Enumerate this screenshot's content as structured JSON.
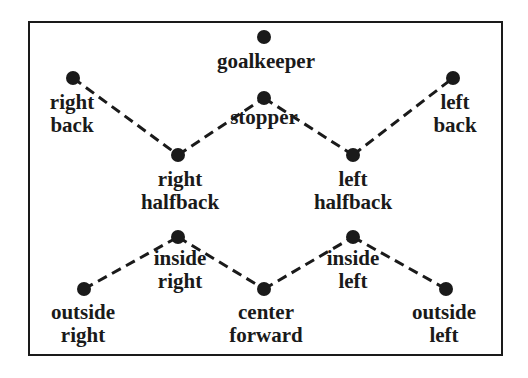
{
  "diagram": {
    "type": "soccer-formation",
    "colors": {
      "ink": "#1a1a1a",
      "background": "#ffffff"
    },
    "positions": [
      {
        "id": "goalkeeper",
        "lines": [
          "goalkeeper"
        ],
        "x": 264,
        "y": 37
      },
      {
        "id": "stopper",
        "lines": [
          "stopper"
        ],
        "x": 264,
        "y": 98
      },
      {
        "id": "right-back",
        "lines": [
          "right",
          "back"
        ],
        "x": 73,
        "y": 78
      },
      {
        "id": "left-back",
        "lines": [
          "left",
          "back"
        ],
        "x": 453,
        "y": 78
      },
      {
        "id": "right-halfback",
        "lines": [
          "right",
          "halfback"
        ],
        "x": 178,
        "y": 155
      },
      {
        "id": "left-halfback",
        "lines": [
          "left",
          "halfback"
        ],
        "x": 353,
        "y": 155
      },
      {
        "id": "inside-right",
        "lines": [
          "inside",
          "right"
        ],
        "x": 178,
        "y": 237
      },
      {
        "id": "inside-left",
        "lines": [
          "inside",
          "left"
        ],
        "x": 353,
        "y": 237
      },
      {
        "id": "outside-right",
        "lines": [
          "outside",
          "right"
        ],
        "x": 84,
        "y": 289
      },
      {
        "id": "center-forward",
        "lines": [
          "center",
          "forward"
        ],
        "x": 264,
        "y": 289
      },
      {
        "id": "outside-left",
        "lines": [
          "outside",
          "left"
        ],
        "x": 446,
        "y": 289
      }
    ],
    "connections": [
      [
        "right-back",
        "right-halfback"
      ],
      [
        "right-halfback",
        "stopper"
      ],
      [
        "stopper",
        "left-halfback"
      ],
      [
        "left-halfback",
        "left-back"
      ],
      [
        "outside-right",
        "inside-right"
      ],
      [
        "inside-right",
        "center-forward"
      ],
      [
        "center-forward",
        "inside-left"
      ],
      [
        "inside-left",
        "outside-left"
      ]
    ]
  },
  "labels": {
    "goalkeeper": [
      "goalkeeper"
    ],
    "stopper": [
      "stopper"
    ],
    "right_back": [
      "right",
      "back"
    ],
    "left_back": [
      "left",
      "back"
    ],
    "right_halfback": [
      "right",
      "halfback"
    ],
    "left_halfback": [
      "left",
      "halfback"
    ],
    "inside_right": [
      "inside",
      "right"
    ],
    "inside_left": [
      "inside",
      "left"
    ],
    "outside_right": [
      "outside",
      "right"
    ],
    "center_forward": [
      "center",
      "forward"
    ],
    "outside_left": [
      "outside",
      "left"
    ]
  }
}
